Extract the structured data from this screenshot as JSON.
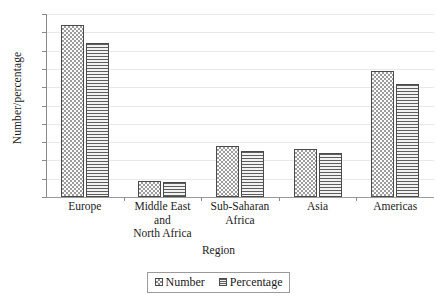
{
  "chart_data": {
    "type": "bar",
    "title": "",
    "xlabel": "Region",
    "ylabel": "Number/percentage",
    "ylim": [
      0,
      50
    ],
    "yticks": [
      0,
      5,
      10,
      15,
      20,
      25,
      30,
      35,
      40,
      45,
      50
    ],
    "grid": true,
    "legend_position": "bottom",
    "categories": [
      "Europe",
      "Middle East and North Africa",
      "Sub-Saharan Africa",
      "Asia",
      "Americas"
    ],
    "category_lines": [
      [
        "Europe"
      ],
      [
        "Middle East",
        "and",
        "North Africa"
      ],
      [
        "Sub-Saharan",
        "Africa"
      ],
      [
        "Asia"
      ],
      [
        "Americas"
      ]
    ],
    "series": [
      {
        "name": "Number",
        "pattern": "checker",
        "values": [
          47,
          4.5,
          14,
          13,
          34.5
        ]
      },
      {
        "name": "Percentage",
        "pattern": "horizontal-lines",
        "values": [
          42,
          4,
          12.5,
          12,
          31
        ]
      }
    ]
  },
  "legend": {
    "entries": [
      "Number",
      "Percentage"
    ]
  },
  "colors": {
    "gridline": "#e9e9e9",
    "axis": "#8a8a8a",
    "bar_outline": "#4a4a4a",
    "text": "#1a1a1a"
  }
}
